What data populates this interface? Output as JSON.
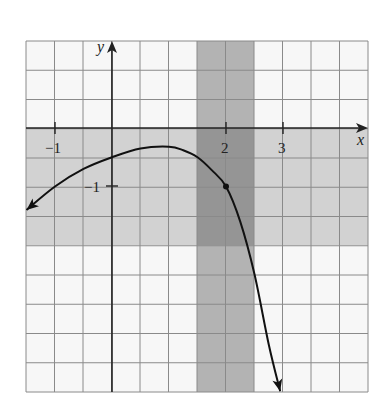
{
  "chart_data": {
    "type": "line",
    "title": "",
    "xlabel": "x",
    "ylabel": "y",
    "xlim": [
      -1.5,
      4.5
    ],
    "ylim": [
      -4.6,
      1.5
    ],
    "grid": true,
    "grid_step": 0.5,
    "x_ticks": [
      {
        "value": -1,
        "label": "−1"
      },
      {
        "value": 2,
        "label": "2"
      },
      {
        "value": 3,
        "label": "3"
      }
    ],
    "y_ticks": [
      {
        "value": -1,
        "label": "−1"
      }
    ],
    "shaded_regions": [
      {
        "orientation": "vertical",
        "x_from": 1.5,
        "x_to": 2.5,
        "label": "domain window"
      },
      {
        "orientation": "horizontal",
        "y_from": -2.0,
        "y_to": 0,
        "label": "range window"
      }
    ],
    "series": [
      {
        "name": "f(x)",
        "arrows": "both ends",
        "x": [
          -1.5,
          -1.0,
          -0.5,
          0.0,
          0.5,
          1.0,
          1.25,
          1.5,
          1.75,
          2.0,
          2.25,
          2.5,
          2.75,
          2.95
        ],
        "y": [
          -1.4,
          -1.0,
          -0.7,
          -0.5,
          -0.35,
          -0.32,
          -0.38,
          -0.5,
          -0.72,
          -1.0,
          -1.6,
          -2.5,
          -3.7,
          -4.5
        ]
      }
    ],
    "marked_points": [
      {
        "x": 2,
        "y": -1
      }
    ]
  },
  "colors": {
    "background": "#ffffff",
    "grid_line": "#8a8a8a",
    "vertical_band": "#a9a9a9",
    "horizontal_band": "#d2d2d2",
    "overlap": "#8f8f8f",
    "curve": "#111111",
    "axis": "#222222"
  },
  "labels": {
    "x_axis": "x",
    "y_axis": "y",
    "x_tick_neg1": "−1",
    "x_tick_2": "2",
    "x_tick_3": "3",
    "y_tick_neg1": "−1"
  }
}
